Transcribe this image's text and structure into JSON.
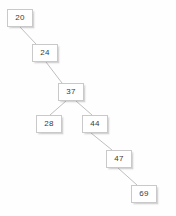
{
  "diagram": {
    "kind": "binary-search-tree",
    "background_color": "#fefefe",
    "node_fill_color": "#ffffff",
    "node_border_color": "#c9c9c9",
    "node_text_color": "#3a3a3a",
    "edge_color": "#bfbfbf",
    "nodes": [
      {
        "id": "n20",
        "label": "20",
        "x": 7,
        "y": 9,
        "depth": 0
      },
      {
        "id": "n24",
        "label": "24",
        "x": 32,
        "y": 44,
        "depth": 1
      },
      {
        "id": "n37",
        "label": "37",
        "x": 58,
        "y": 83,
        "depth": 2
      },
      {
        "id": "n28",
        "label": "28",
        "x": 36,
        "y": 115,
        "depth": 3
      },
      {
        "id": "n44",
        "label": "44",
        "x": 82,
        "y": 115,
        "depth": 3
      },
      {
        "id": "n47",
        "label": "47",
        "x": 106,
        "y": 150,
        "depth": 4
      },
      {
        "id": "n69",
        "label": "69",
        "x": 131,
        "y": 185,
        "depth": 5
      }
    ],
    "edges": [
      {
        "id": "e20-24",
        "from": "n20",
        "to": "n24",
        "side": "right",
        "x1": 20,
        "y1": 27,
        "x2": 36,
        "y2": 44
      },
      {
        "id": "e24-37",
        "from": "n24",
        "to": "n37",
        "side": "right",
        "x1": 46,
        "y1": 62,
        "x2": 62,
        "y2": 83
      },
      {
        "id": "e37-28",
        "from": "n37",
        "to": "n28",
        "side": "left",
        "x1": 66,
        "y1": 101,
        "x2": 50,
        "y2": 115
      },
      {
        "id": "e37-44",
        "from": "n37",
        "to": "n44",
        "side": "right",
        "x1": 76,
        "y1": 101,
        "x2": 92,
        "y2": 115
      },
      {
        "id": "e44-47",
        "from": "n44",
        "to": "n47",
        "side": "right",
        "x1": 91,
        "y1": 133,
        "x2": 112,
        "y2": 150
      },
      {
        "id": "e47-69",
        "from": "n47",
        "to": "n69",
        "side": "right",
        "x1": 118,
        "y1": 168,
        "x2": 137,
        "y2": 185
      }
    ]
  }
}
